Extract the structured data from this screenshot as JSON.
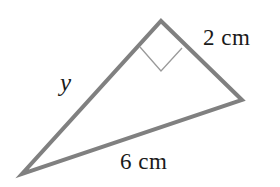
{
  "figure": {
    "kind": "geometry-diagram",
    "background_color": "#ffffff",
    "stroke_color": "#808080",
    "marker_color": "#9a9a9a",
    "text_color": "#1a1a1a",
    "canvas": {
      "width": 280,
      "height": 187
    },
    "triangle": {
      "vertices": [
        {
          "name": "apex",
          "x": 161,
          "y": 21
        },
        {
          "name": "right",
          "x": 242,
          "y": 100
        },
        {
          "name": "bottom-left",
          "x": 22,
          "y": 174
        }
      ],
      "stroke_width": 4,
      "fill": "none"
    },
    "right_angle_marker": {
      "at_vertex": "apex",
      "points": [
        {
          "x": 140,
          "y": 47
        },
        {
          "x": 161,
          "y": 71
        },
        {
          "x": 182,
          "y": 48
        }
      ],
      "stroke_width": 1
    },
    "labels": {
      "side_a": "2 cm",
      "side_b": "6 cm",
      "side_y": "y"
    }
  }
}
